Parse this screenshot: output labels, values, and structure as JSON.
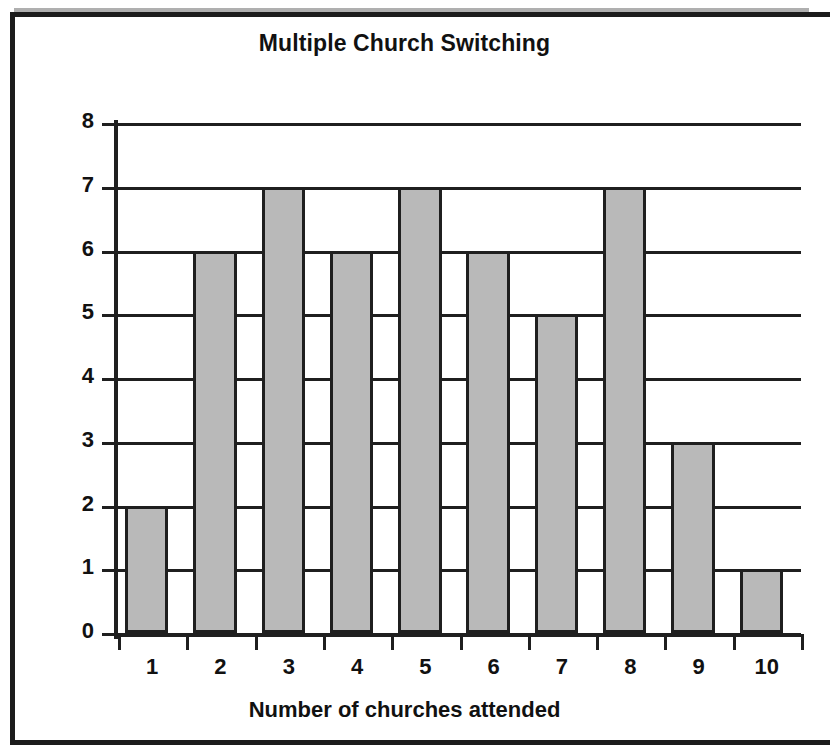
{
  "chart_data": {
    "type": "bar",
    "title": "Multiple Church Switching",
    "xlabel": "Number of churches attended",
    "ylabel": "Number of people",
    "categories": [
      "1",
      "2",
      "3",
      "4",
      "5",
      "6",
      "7",
      "8",
      "9",
      "10"
    ],
    "values": [
      2,
      6,
      7,
      6,
      7,
      6,
      5,
      7,
      3,
      1
    ],
    "ylim": [
      0,
      8
    ],
    "ytick_labels": [
      "0",
      "1",
      "2",
      "3",
      "4",
      "5",
      "6",
      "7",
      "8"
    ],
    "yticks": [
      0,
      1,
      2,
      3,
      4,
      5,
      6,
      7,
      8
    ],
    "grid": "horizontal",
    "legend": "none",
    "bar_fill_color": "#b9b9b9",
    "bar_edge_color": "#1f1f1f",
    "axis_color": "#1f1f1f",
    "background_color": "#ffffff"
  }
}
